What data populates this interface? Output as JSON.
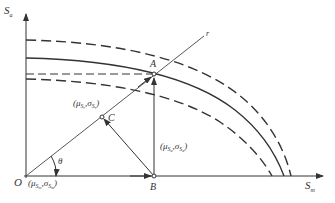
{
  "diagram": {
    "type": "stress-interference-diagram",
    "axes": {
      "y_label": "S",
      "y_label_sub": "a",
      "x_label": "S",
      "x_label_sub": "m",
      "origin_label": "O"
    },
    "origin_annotation": {
      "mu": "μ",
      "mu_sub": "S",
      "mu_subsub": "m",
      "sigma": "σ",
      "sigma_sub": "S",
      "sigma_subsub": "m"
    },
    "ray_label": "r",
    "angle_label": "θ",
    "points": {
      "A": "A",
      "B": "B",
      "C": "C"
    },
    "C_annotation": {
      "mu": "μ",
      "mu_sub": "S",
      "mu_subsub": "r",
      "sigma": "σ",
      "sigma_sub": "S",
      "sigma_subsub": "r"
    },
    "AB_annotation": {
      "mu": "μ",
      "mu_sub": "S",
      "mu_subsub": "a",
      "sigma": "σ",
      "sigma_sub": "S",
      "sigma_subsub": "a"
    },
    "curves": [
      {
        "name": "upper-limit-curve",
        "style": "dashed"
      },
      {
        "name": "mean-limit-curve",
        "style": "solid"
      },
      {
        "name": "lower-limit-curve",
        "style": "dashed"
      }
    ],
    "colors": {
      "line": "#333333",
      "background": "#ffffff"
    }
  }
}
